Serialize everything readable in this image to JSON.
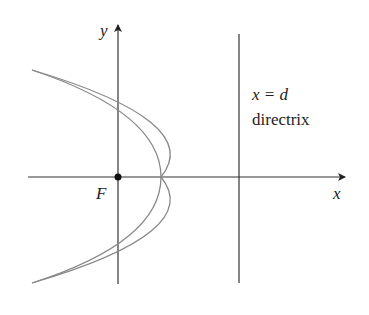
{
  "diagram": {
    "type": "parabola-focus-directrix",
    "labels": {
      "y_axis": "y",
      "x_axis": "x",
      "focus": "F",
      "directrix_eq": "x = d",
      "directrix_name": "directrix"
    },
    "colors": {
      "axes": "#333333",
      "curve": "#888888",
      "text": "#222222"
    },
    "geometry": {
      "origin_px": [
        118,
        177
      ],
      "directrix_x_px": 239,
      "vertex_px": [
        161,
        177
      ],
      "curve_endpoints_px": [
        [
          32,
          70
        ],
        [
          32,
          283
        ]
      ],
      "y_axis_intercepts_px": [
        110,
        243
      ]
    }
  }
}
